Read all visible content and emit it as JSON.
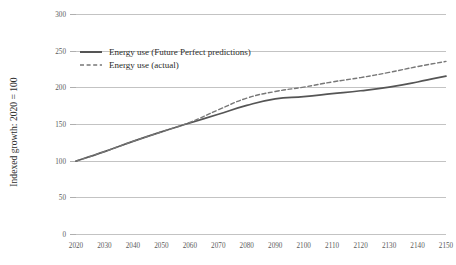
{
  "chart_data": {
    "type": "line",
    "title": "",
    "xlabel": "",
    "ylabel": "Indexed growth: 2020 = 100",
    "ylim": [
      0,
      300
    ],
    "xlim": [
      2020,
      2150
    ],
    "grid": "horizontal",
    "legend_position": "top-left inside plot",
    "y_ticks": [
      "0",
      "50",
      "100",
      "150",
      "200",
      "250",
      "300"
    ],
    "y_tick_values": [
      0,
      50,
      100,
      150,
      200,
      250,
      300
    ],
    "x_ticks": [
      "2020",
      "2030",
      "2040",
      "2050",
      "2060",
      "2070",
      "2080",
      "2090",
      "2100",
      "2110",
      "2120",
      "2130",
      "2140",
      "2150"
    ],
    "x": [
      2020,
      2030,
      2040,
      2050,
      2060,
      2070,
      2080,
      2090,
      2100,
      2110,
      2120,
      2130,
      2140,
      2150
    ],
    "series": [
      {
        "name": "Energy use (Future Perfect predictions)",
        "style": "solid",
        "color": "#555555",
        "values": [
          100,
          113,
          127,
          140,
          152,
          164,
          176,
          185,
          188,
          192,
          196,
          201,
          208,
          216
        ]
      },
      {
        "name": "Energy use (actual)",
        "style": "dashed",
        "color": "#777777",
        "values": [
          100,
          113,
          127,
          140,
          153,
          170,
          186,
          195,
          201,
          208,
          214,
          221,
          229,
          236
        ]
      }
    ]
  },
  "legend": {
    "items": [
      {
        "label": "Energy use (Future Perfect predictions)",
        "style": "solid"
      },
      {
        "label": "Energy use (actual)",
        "style": "dashed"
      }
    ]
  },
  "colors": {
    "background": "#ffffff",
    "grid": "#a9a9a9",
    "solid_series": "#555555",
    "dashed_series": "#777777",
    "tick_text": "#5b5b5b",
    "axis_title_text": "#2e2e2e"
  }
}
